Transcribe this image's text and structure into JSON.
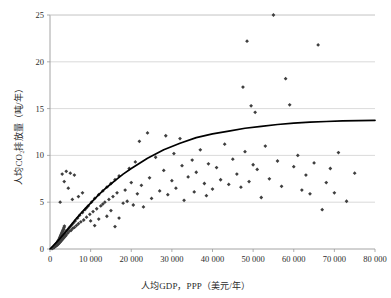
{
  "chart_data": {
    "type": "scatter",
    "title": "",
    "xlabel": "人均GDP，PPP（美元/年）",
    "ylabel": "人均CO₂排放量（吨/年）",
    "xlim": [
      0,
      80000
    ],
    "ylim": [
      0,
      25
    ],
    "xticks": [
      0,
      10000,
      20000,
      30000,
      40000,
      50000,
      60000,
      70000,
      80000
    ],
    "xticklabels": [
      "0",
      "10 000",
      "20 000",
      "30 000",
      "40 000",
      "50 000",
      "60 000",
      "70 000",
      "80 000"
    ],
    "yticks": [
      0,
      5,
      10,
      15,
      20,
      25
    ],
    "yticklabels": [
      "0",
      "5",
      "10",
      "15",
      "20",
      "25"
    ],
    "grid": "horizontal",
    "legend": "none",
    "marker_color": "#3f3f3f",
    "marker_shape": "diamond",
    "trendline_color": "#000000",
    "series": [
      {
        "name": "国家数据点",
        "marker": "diamond",
        "points": [
          [
            700,
            0.1
          ],
          [
            900,
            0.2
          ],
          [
            1000,
            0.15
          ],
          [
            1100,
            0.3
          ],
          [
            1200,
            0.25
          ],
          [
            1300,
            0.4
          ],
          [
            1400,
            0.3
          ],
          [
            1500,
            0.5
          ],
          [
            1600,
            0.35
          ],
          [
            1700,
            0.6
          ],
          [
            1800,
            0.45
          ],
          [
            1900,
            0.7
          ],
          [
            2000,
            0.5
          ],
          [
            2100,
            0.8
          ],
          [
            2200,
            0.6
          ],
          [
            2300,
            0.9
          ],
          [
            2400,
            0.7
          ],
          [
            2500,
            1.0
          ],
          [
            2600,
            0.8
          ],
          [
            2700,
            1.1
          ],
          [
            2800,
            0.9
          ],
          [
            2900,
            1.2
          ],
          [
            3000,
            1.0
          ],
          [
            3100,
            1.3
          ],
          [
            3200,
            1.1
          ],
          [
            3300,
            1.5
          ],
          [
            3400,
            1.2
          ],
          [
            3500,
            1.6
          ],
          [
            3600,
            1.3
          ],
          [
            3700,
            1.7
          ],
          [
            3800,
            1.4
          ],
          [
            3900,
            1.9
          ],
          [
            4000,
            1.5
          ],
          [
            4200,
            2.0
          ],
          [
            4400,
            1.7
          ],
          [
            4600,
            2.2
          ],
          [
            4800,
            1.9
          ],
          [
            5000,
            2.4
          ],
          [
            5200,
            2.0
          ],
          [
            5400,
            2.6
          ],
          [
            5600,
            2.2
          ],
          [
            5800,
            2.8
          ],
          [
            6000,
            2.3
          ],
          [
            6200,
            3.0
          ],
          [
            6500,
            2.5
          ],
          [
            6800,
            3.3
          ],
          [
            7000,
            2.7
          ],
          [
            7300,
            3.6
          ],
          [
            7600,
            2.9
          ],
          [
            8000,
            3.9
          ],
          [
            8300,
            3.1
          ],
          [
            8600,
            4.2
          ],
          [
            9000,
            3.4
          ],
          [
            9400,
            4.6
          ],
          [
            9800,
            3.7
          ],
          [
            10200,
            5.0
          ],
          [
            10600,
            4.0
          ],
          [
            11000,
            5.4
          ],
          [
            11500,
            4.3
          ],
          [
            12000,
            5.8
          ],
          [
            12500,
            4.6
          ],
          [
            13000,
            6.2
          ],
          [
            13500,
            5.0
          ],
          [
            14000,
            6.6
          ],
          [
            14500,
            5.3
          ],
          [
            15000,
            7.0
          ],
          [
            15500,
            5.6
          ],
          [
            16000,
            7.4
          ],
          [
            16500,
            6.0
          ],
          [
            17000,
            7.8
          ],
          [
            2500,
            5.0
          ],
          [
            3000,
            8.0
          ],
          [
            3500,
            7.2
          ],
          [
            4000,
            8.3
          ],
          [
            4500,
            6.5
          ],
          [
            5000,
            8.1
          ],
          [
            5500,
            5.3
          ],
          [
            6000,
            7.9
          ],
          [
            7000,
            5.6
          ],
          [
            8000,
            6.0
          ],
          [
            9000,
            4.4
          ],
          [
            10000,
            3.0
          ],
          [
            11000,
            2.5
          ],
          [
            12000,
            3.2
          ],
          [
            13000,
            4.8
          ],
          [
            14000,
            3.5
          ],
          [
            15000,
            4.1
          ],
          [
            16000,
            2.4
          ],
          [
            17000,
            3.3
          ],
          [
            18000,
            4.9
          ],
          [
            18500,
            6.3
          ],
          [
            19000,
            5.1
          ],
          [
            19500,
            8.6
          ],
          [
            20000,
            7.1
          ],
          [
            20500,
            4.7
          ],
          [
            21000,
            9.3
          ],
          [
            21500,
            5.9
          ],
          [
            22000,
            11.5
          ],
          [
            22500,
            6.8
          ],
          [
            23000,
            4.5
          ],
          [
            24000,
            12.4
          ],
          [
            24500,
            7.6
          ],
          [
            25000,
            5.4
          ],
          [
            26000,
            9.8
          ],
          [
            27000,
            6.2
          ],
          [
            28000,
            8.4
          ],
          [
            28500,
            12.1
          ],
          [
            29000,
            5.8
          ],
          [
            30000,
            7.3
          ],
          [
            30500,
            10.2
          ],
          [
            31000,
            6.5
          ],
          [
            32000,
            11.8
          ],
          [
            32500,
            8.9
          ],
          [
            33000,
            5.2
          ],
          [
            34000,
            7.7
          ],
          [
            35000,
            9.5
          ],
          [
            35500,
            6.1
          ],
          [
            36000,
            8.2
          ],
          [
            37000,
            10.6
          ],
          [
            38000,
            7.0
          ],
          [
            38500,
            5.7
          ],
          [
            39000,
            9.1
          ],
          [
            40000,
            6.4
          ],
          [
            41000,
            8.7
          ],
          [
            42000,
            7.4
          ],
          [
            43000,
            11.2
          ],
          [
            44000,
            6.9
          ],
          [
            45000,
            9.6
          ],
          [
            46000,
            8.0
          ],
          [
            47000,
            6.6
          ],
          [
            47500,
            17.3
          ],
          [
            48000,
            10.4
          ],
          [
            48500,
            22.2
          ],
          [
            49000,
            7.2
          ],
          [
            49500,
            15.3
          ],
          [
            50000,
            9.0
          ],
          [
            50500,
            14.6
          ],
          [
            51000,
            8.5
          ],
          [
            52000,
            5.5
          ],
          [
            53000,
            11.0
          ],
          [
            54000,
            7.5
          ],
          [
            55000,
            25.0
          ],
          [
            56000,
            9.4
          ],
          [
            57000,
            6.7
          ],
          [
            58000,
            18.2
          ],
          [
            59000,
            15.4
          ],
          [
            60000,
            8.8
          ],
          [
            61000,
            10.0
          ],
          [
            62000,
            6.3
          ],
          [
            63000,
            7.9
          ],
          [
            64000,
            5.9
          ],
          [
            65000,
            9.2
          ],
          [
            66000,
            21.8
          ],
          [
            67000,
            4.2
          ],
          [
            68000,
            7.1
          ],
          [
            69000,
            8.6
          ],
          [
            70000,
            6.0
          ],
          [
            71000,
            10.3
          ],
          [
            73000,
            5.1
          ],
          [
            75000,
            8.1
          ],
          [
            500,
            0.05
          ],
          [
            600,
            0.12
          ],
          [
            800,
            0.18
          ],
          [
            950,
            0.22
          ],
          [
            1050,
            0.28
          ],
          [
            1150,
            0.33
          ],
          [
            1250,
            0.38
          ],
          [
            1350,
            0.44
          ],
          [
            1450,
            0.48
          ],
          [
            1550,
            0.55
          ],
          [
            1650,
            0.62
          ],
          [
            1750,
            0.68
          ],
          [
            1850,
            0.75
          ],
          [
            1950,
            0.82
          ],
          [
            2050,
            0.88
          ],
          [
            2150,
            0.95
          ],
          [
            2250,
            1.05
          ],
          [
            2350,
            1.15
          ],
          [
            2450,
            1.25
          ],
          [
            2550,
            1.35
          ],
          [
            2650,
            1.45
          ],
          [
            2750,
            1.55
          ],
          [
            2850,
            1.65
          ],
          [
            2950,
            1.75
          ],
          [
            3050,
            1.85
          ],
          [
            3150,
            1.95
          ],
          [
            3250,
            2.05
          ],
          [
            3350,
            2.15
          ],
          [
            3450,
            2.3
          ],
          [
            3550,
            2.45
          ]
        ]
      }
    ],
    "trendline": {
      "name": "趋势线",
      "points": [
        [
          0,
          0.0
        ],
        [
          2000,
          0.9
        ],
        [
          4000,
          1.9
        ],
        [
          6000,
          3.0
        ],
        [
          8000,
          4.0
        ],
        [
          10000,
          4.9
        ],
        [
          12000,
          5.8
        ],
        [
          14000,
          6.6
        ],
        [
          16000,
          7.3
        ],
        [
          18000,
          8.0
        ],
        [
          20000,
          8.6
        ],
        [
          24000,
          9.7
        ],
        [
          28000,
          10.6
        ],
        [
          32000,
          11.3
        ],
        [
          36000,
          11.9
        ],
        [
          40000,
          12.3
        ],
        [
          44000,
          12.6
        ],
        [
          48000,
          12.9
        ],
        [
          52000,
          13.1
        ],
        [
          56000,
          13.3
        ],
        [
          60000,
          13.45
        ],
        [
          64000,
          13.55
        ],
        [
          68000,
          13.62
        ],
        [
          72000,
          13.68
        ],
        [
          76000,
          13.72
        ],
        [
          80000,
          13.75
        ]
      ]
    }
  }
}
